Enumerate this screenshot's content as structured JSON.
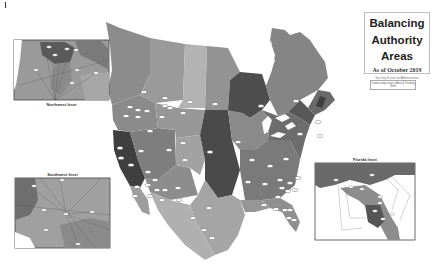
{
  "title": {
    "line1": "Balancing",
    "line2": "Authority",
    "line3": "Areas",
    "date": "As of October 2019",
    "subtitle": "See key & note for Abbreviations",
    "contact": "Contact map source: Area & Tracking Staff"
  },
  "insets": {
    "northwest": {
      "caption": "Northwest Inset"
    },
    "southwest": {
      "caption": "Southwest Inset"
    },
    "florida": {
      "caption": "Florida Inset"
    }
  },
  "colors": {
    "background": "#ffffff",
    "region_light": "#a8a8a8",
    "region_mid": "#8a8a8a",
    "region_dark": "#5e5e5e",
    "region_darkest": "#454545",
    "water": "#ffffff",
    "label_oval": "#ffffff"
  }
}
